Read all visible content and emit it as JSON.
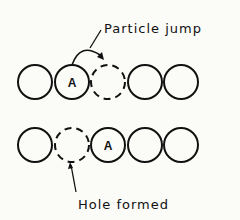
{
  "diagram": {
    "top_row": {
      "label": "Particle jump",
      "particle_label": "A",
      "circles": [
        {
          "cx": 35,
          "style": "solid",
          "label": ""
        },
        {
          "cx": 72,
          "style": "solid",
          "label": "A"
        },
        {
          "cx": 108,
          "style": "dashed",
          "label": ""
        },
        {
          "cx": 145,
          "style": "solid",
          "label": ""
        },
        {
          "cx": 181,
          "style": "solid",
          "label": ""
        }
      ]
    },
    "bottom_row": {
      "label": "Hole formed",
      "particle_label": "A",
      "circles": [
        {
          "cx": 35,
          "style": "solid",
          "label": ""
        },
        {
          "cx": 72,
          "style": "dashed",
          "label": ""
        },
        {
          "cx": 108,
          "style": "solid",
          "label": "A"
        },
        {
          "cx": 145,
          "style": "solid",
          "label": ""
        },
        {
          "cx": 181,
          "style": "solid",
          "label": ""
        }
      ]
    },
    "colors": {
      "stroke": "#111111",
      "background": "#fbfbf8"
    }
  }
}
